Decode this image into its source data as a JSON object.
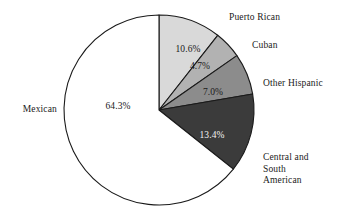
{
  "chart_data": {
    "type": "pie",
    "title": "",
    "subtitle": "",
    "xlabel": "",
    "ylabel": "",
    "grid": false,
    "legend_position": "none",
    "label_style": "callout-labels-outside-with-percent-inside",
    "start_angle_deg_from_top": 0,
    "direction": "clockwise",
    "categories": [
      "Puerto Rican",
      "Cuban",
      "Other Hispanic",
      "Central and South American",
      "Mexican"
    ],
    "values": [
      10.6,
      4.7,
      7.0,
      13.4,
      64.3
    ],
    "value_labels": [
      "10.6%",
      "4.7%",
      "7.0%",
      "13.4%",
      "64.3%"
    ],
    "colors": [
      "#d9d9d9",
      "#b2b2b2",
      "#8c8c8c",
      "#3b3b3b",
      "#ffffff"
    ],
    "slices": [
      {
        "name": "Puerto Rican",
        "value": 10.6,
        "value_label": "10.6%",
        "color": "#d9d9d9",
        "label_text_color": "#1a1a1a",
        "start_deg": 0.0,
        "end_deg": 38.16,
        "pct_x": 188,
        "pct_y": 49,
        "cat_label": "Puerto Rican",
        "cat_x": 229,
        "cat_y": 18,
        "cat_side": "right"
      },
      {
        "name": "Cuban",
        "value": 4.7,
        "value_label": "4.7%",
        "color": "#b2b2b2",
        "label_text_color": "#1a1a1a",
        "start_deg": 38.16,
        "end_deg": 55.08,
        "pct_x": 200,
        "pct_y": 66,
        "cat_label": "Cuban",
        "cat_x": 252,
        "cat_y": 46,
        "cat_side": "right"
      },
      {
        "name": "Other Hispanic",
        "value": 7.0,
        "value_label": "7.0%",
        "color": "#8c8c8c",
        "label_text_color": "#1a1a1a",
        "start_deg": 55.08,
        "end_deg": 80.28,
        "pct_x": 213,
        "pct_y": 92,
        "cat_label": "Other Hispanic",
        "cat_x": 263,
        "cat_y": 84,
        "cat_side": "right"
      },
      {
        "name": "Central and South American",
        "value": 13.4,
        "value_label": "13.4%",
        "color": "#3b3b3b",
        "label_text_color": "#f2f2f2",
        "start_deg": 80.28,
        "end_deg": 128.52,
        "pct_x": 212,
        "pct_y": 135,
        "cat_label": "Central and\nSouth\nAmerican",
        "cat_x": 263,
        "cat_y": 169,
        "cat_side": "right"
      },
      {
        "name": "Mexican",
        "value": 64.3,
        "value_label": "64.3%",
        "color": "#ffffff",
        "label_text_color": "#1a1a1a",
        "start_deg": 128.52,
        "end_deg": 360.0,
        "pct_x": 118,
        "pct_y": 106,
        "cat_label": "Mexican",
        "cat_x": 57,
        "cat_y": 110,
        "cat_side": "left"
      }
    ],
    "geometry": {
      "center_x": 159,
      "center_y": 110,
      "radius": 95
    },
    "total": 100.0
  }
}
